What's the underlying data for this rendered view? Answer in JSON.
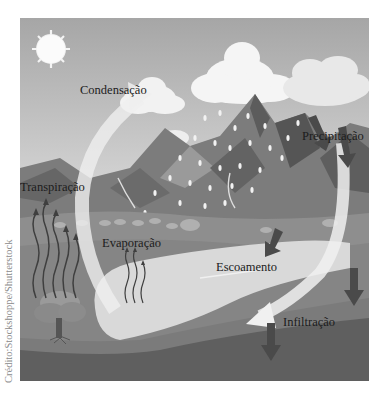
{
  "figure": {
    "labels": {
      "condensation": "Condensação",
      "precipitation": "Precipitação",
      "transpiration": "Transpiração",
      "evaporation": "Evaporação",
      "runoff": "Escoamento",
      "infiltration": "Infiltração"
    },
    "credit": "Crédito:Stockshoppe/Shutterstock",
    "colors": {
      "sky_top": "#a8a8a8",
      "sky_bottom": "#e2e2e2",
      "mountain_dark": "#5a5a5a",
      "mountain_mid": "#7a7a7a",
      "ground": "#8c8c8c",
      "lake": "#d8d8d8",
      "soil": "#6a6a6a",
      "arrow_dark": "#4a4a4a",
      "cycle_arrow": "#ececec"
    }
  }
}
